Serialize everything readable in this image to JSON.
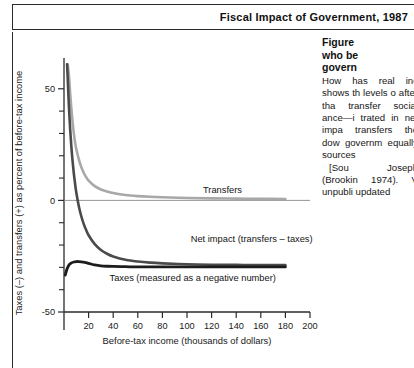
{
  "header": {
    "title": "Fiscal Impact of Government, 1987"
  },
  "figure_caption": {
    "heading_line1": "Figure",
    "heading_line2": "who be",
    "heading_line3": "govern",
    "paragraph1": "How has real inc shows th levels o after tha transfer social ance—i trated in net impa transfers the dow governm equally sources",
    "paragraph2": "[Sou Joseph (Brookin 1974). V unpubli updated"
  },
  "chart_data": {
    "type": "line",
    "title": "",
    "xlabel": "Before-tax income (thousands of dollars)",
    "ylabel": "Taxes (–) and transfers (+) as percent of before-tax income",
    "xlim": [
      0,
      200
    ],
    "ylim": [
      -50,
      62
    ],
    "xticks": [
      20,
      40,
      60,
      80,
      100,
      120,
      140,
      160,
      180,
      200
    ],
    "yticks_labeled": [
      {
        "value": 50,
        "label": "50"
      },
      {
        "value": 0,
        "label": "0"
      },
      {
        "value": -50,
        "label": "-50"
      }
    ],
    "yticks_minor": [
      40,
      30,
      20,
      10,
      -10,
      -20,
      -30,
      -40
    ],
    "grid": false,
    "legend": "inline-labels",
    "series": [
      {
        "name": "Transfers",
        "label": "Transfers",
        "color": "#a8a8a8",
        "width": 2.6,
        "label_x": 113,
        "label_y": 3.5,
        "x": [
          3,
          4,
          5,
          6,
          7,
          8,
          9,
          10,
          12,
          14,
          16,
          18,
          20,
          25,
          30,
          35,
          40,
          50,
          60,
          70,
          80,
          100,
          120,
          140,
          160,
          180
        ],
        "y": [
          61,
          56,
          48,
          41,
          35,
          30,
          26,
          23,
          18.5,
          15,
          12.4,
          10.4,
          8.9,
          6.4,
          4.9,
          4.0,
          3.3,
          2.4,
          1.9,
          1.6,
          1.4,
          1.1,
          0.9,
          0.8,
          0.7,
          0.6
        ]
      },
      {
        "name": "Net impact (transfers − taxes)",
        "label": "Net impact (transfers – taxes)",
        "color": "#4a4a4a",
        "width": 2.6,
        "label_x": 103,
        "label_y": -18.5,
        "x": [
          2.5,
          3,
          4,
          5,
          6,
          7,
          8,
          9,
          10,
          12,
          14,
          16,
          18,
          20,
          25,
          30,
          35,
          40,
          50,
          60,
          70,
          80,
          100,
          120,
          140,
          160,
          180
        ],
        "y": [
          61,
          55,
          42,
          32,
          24,
          17.5,
          12,
          7.5,
          3.5,
          -2.5,
          -7,
          -10.5,
          -13.3,
          -15.6,
          -19.6,
          -22.2,
          -23.9,
          -25.1,
          -26.6,
          -27.4,
          -27.9,
          -28.2,
          -28.6,
          -28.8,
          -28.9,
          -29.0,
          -29.0
        ]
      },
      {
        "name": "Taxes (measured as a negative number)",
        "label": "Taxes (measured as a negative number)",
        "color": "#1c1c1c",
        "width": 2.8,
        "label_x": 37,
        "label_y": -36,
        "x": [
          1,
          2,
          3,
          4,
          5,
          6,
          8,
          10,
          12,
          14,
          16,
          18,
          20,
          22,
          25,
          30,
          35,
          40,
          50,
          60,
          70,
          80,
          100,
          120,
          140,
          160,
          180
        ],
        "y": [
          -33.5,
          -31.5,
          -30.0,
          -29.0,
          -28.4,
          -28.0,
          -27.6,
          -27.4,
          -27.4,
          -27.5,
          -27.7,
          -27.9,
          -28.2,
          -28.5,
          -28.9,
          -29.3,
          -29.5,
          -29.6,
          -29.7,
          -29.8,
          -29.8,
          -29.8,
          -29.8,
          -29.8,
          -29.8,
          -29.8,
          -29.8
        ]
      }
    ],
    "colors": {
      "transfers": "#a8a8a8",
      "net_impact": "#4a4a4a",
      "taxes": "#1c1c1c",
      "axis": "#2b2b2b"
    }
  }
}
